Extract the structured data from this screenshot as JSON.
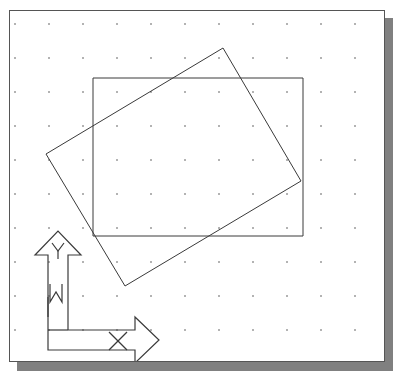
{
  "app": {
    "title": "CAD Drawing Canvas",
    "background_color": "#ffffff",
    "sheet_color": "#ffffff",
    "sheet_border_color": "#555555",
    "shadow_color": "#808080",
    "ink_color": "#3a3a3a",
    "grid_dot_color": "#8a8a8a"
  },
  "canvas": {
    "label": "drawing-area",
    "width": 376,
    "height": 352,
    "origin_x": 9,
    "origin_y": 10
  },
  "grid": {
    "label": "snap-dot-grid",
    "visible": true,
    "spacing_x": 34,
    "spacing_y": 34,
    "offset_x": 5,
    "offset_y": 13,
    "columns": 11,
    "rows": 10,
    "dot_size": 1.6
  },
  "shapes": [
    {
      "name": "rectangle-axis-aligned",
      "type": "rectangle",
      "rotation_deg": 0,
      "points": [
        [
          83,
          67
        ],
        [
          293,
          67
        ],
        [
          293,
          225
        ],
        [
          83,
          225
        ]
      ]
    },
    {
      "name": "rectangle-rotated",
      "type": "rectangle",
      "rotation_deg": -18,
      "points": [
        [
          213,
          37
        ],
        [
          291,
          170
        ],
        [
          115,
          275
        ],
        [
          36,
          143
        ]
      ]
    }
  ],
  "ucs_icon": {
    "name": "ucs-axis-indicator",
    "labels": {
      "y_axis": "Y",
      "x_axis": "X",
      "world": "W"
    },
    "y_arrow_outline": [
      [
        38,
        267
      ],
      [
        38,
        244
      ],
      [
        25,
        244
      ],
      [
        48,
        220
      ],
      [
        71,
        244
      ],
      [
        58,
        244
      ],
      [
        58,
        267
      ]
    ],
    "x_arrow_outline": [
      [
        38,
        286
      ],
      [
        38,
        306
      ],
      [
        38,
        339
      ],
      [
        125,
        339
      ],
      [
        125,
        352
      ],
      [
        149,
        329
      ],
      [
        125,
        306
      ],
      [
        125,
        319
      ],
      [
        58,
        319
      ]
    ],
    "corner_path": [
      [
        38,
        267
      ],
      [
        38,
        306
      ]
    ],
    "shaft_inner_v": [
      [
        58,
        267
      ],
      [
        58,
        319
      ]
    ],
    "base_line": [
      [
        38,
        319
      ],
      [
        58,
        319
      ]
    ],
    "y_glyph": [
      [
        42,
        232
      ],
      [
        48,
        240
      ],
      [
        54,
        232
      ]
    ],
    "y_glyph_stem": [
      [
        48,
        240
      ],
      [
        48,
        248
      ]
    ],
    "w_glyph": [
      [
        40,
        273
      ],
      [
        40,
        291
      ],
      [
        46,
        281
      ],
      [
        52,
        291
      ],
      [
        52,
        273
      ]
    ],
    "x_glyph": [
      [
        99,
        321
      ],
      [
        117,
        339
      ]
    ],
    "x_glyph_b": [
      [
        117,
        321
      ],
      [
        99,
        339
      ]
    ]
  }
}
